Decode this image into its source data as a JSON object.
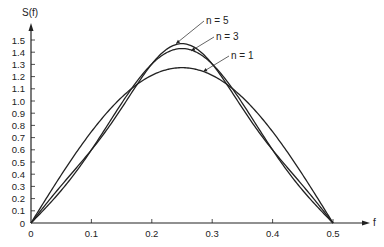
{
  "chart_data": {
    "type": "line",
    "title": "",
    "xlabel": "f",
    "ylabel": "S(f)",
    "xlim": [
      0,
      0.5
    ],
    "ylim": [
      0,
      1.5
    ],
    "xticks": [
      "0",
      "0.1",
      "0.2",
      "0.3",
      "0.4",
      "0.5"
    ],
    "yticks": [
      "0",
      "0.1",
      "0.2",
      "0.3",
      "0.4",
      "0.5",
      "0.6",
      "0.7",
      "0.8",
      "0.9",
      "1.0",
      "1.1",
      "1.2",
      "1.3",
      "1.4",
      "1.5"
    ],
    "grid": false,
    "legend": "annotations with leader lines near peaks",
    "x": [
      0,
      0.025,
      0.05,
      0.075,
      0.1,
      0.125,
      0.15,
      0.175,
      0.2,
      0.225,
      0.25,
      0.275,
      0.3,
      0.325,
      0.35,
      0.375,
      0.4,
      0.425,
      0.45,
      0.475,
      0.5
    ],
    "series": [
      {
        "name": "n = 1",
        "values": [
          0,
          0.2,
          0.39,
          0.58,
          0.75,
          0.9,
          1.03,
          1.13,
          1.21,
          1.26,
          1.27,
          1.26,
          1.21,
          1.13,
          1.03,
          0.9,
          0.75,
          0.58,
          0.39,
          0.2,
          0
        ]
      },
      {
        "name": "n = 3",
        "values": [
          0,
          0.13,
          0.26,
          0.43,
          0.6,
          0.79,
          0.98,
          1.13,
          1.28,
          1.39,
          1.43,
          1.39,
          1.28,
          1.13,
          0.98,
          0.79,
          0.6,
          0.43,
          0.26,
          0.13,
          0
        ]
      },
      {
        "name": "n = 5",
        "values": [
          0,
          0.16,
          0.3,
          0.45,
          0.6,
          0.76,
          0.95,
          1.12,
          1.3,
          1.42,
          1.47,
          1.42,
          1.3,
          1.12,
          0.95,
          0.76,
          0.6,
          0.45,
          0.3,
          0.16,
          0
        ]
      }
    ],
    "annotations": [
      {
        "text": "n = 5",
        "points_to": [
          0.24,
          1.47
        ]
      },
      {
        "text": "n = 3",
        "points_to": [
          0.265,
          1.41
        ]
      },
      {
        "text": "n = 1",
        "points_to": [
          0.285,
          1.24
        ]
      }
    ],
    "line_color": "#222222"
  }
}
